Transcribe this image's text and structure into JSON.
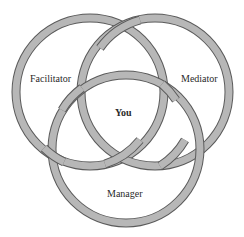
{
  "diagram": {
    "type": "venn",
    "ring_fill": "#b7b7b7",
    "ring_outline": "#5a5a5a",
    "ring_width": 8,
    "circles": [
      {
        "id": "facilitator",
        "label": "Facilitator",
        "cx": 90,
        "cy": 92,
        "r": 74
      },
      {
        "id": "mediator",
        "label": "Mediator",
        "cx": 155,
        "cy": 92,
        "r": 74
      },
      {
        "id": "manager",
        "label": "Manager",
        "cx": 126,
        "cy": 149,
        "r": 74
      }
    ],
    "center_label": "You"
  }
}
